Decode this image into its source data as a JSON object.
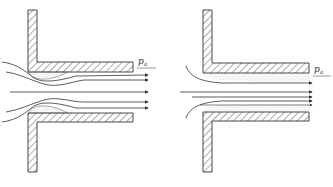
{
  "figures": [
    {
      "id": "left",
      "description": "Flow entering a sharp-edged re-entrant tube with separation bubbles (vena contracta) near the inlet",
      "pressure_label": {
        "symbol": "p",
        "subscript": "a"
      }
    },
    {
      "id": "right",
      "description": "Flow entering a tube with attached boundary layer along the walls (no separation)",
      "pressure_label": {
        "symbol": "p",
        "subscript": "a"
      }
    }
  ],
  "colors": {
    "line": "#333333",
    "hatch": "#555555",
    "stipple": "#888888",
    "background": "#ffffff"
  }
}
